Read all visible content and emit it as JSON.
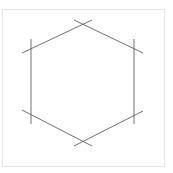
{
  "figure": {
    "background_color": "#ffffff",
    "frame": {
      "visible": true,
      "color": "#e6e6e6",
      "stroke_width": 1,
      "x": 2,
      "y": 9,
      "width": 163,
      "height": 158
    },
    "stroke": {
      "color": "#5a5a5a",
      "width": 1,
      "style": "solid",
      "opacity": 0.85
    },
    "shape": {
      "name": "hexagon",
      "sides": 6,
      "orientation": "pointy-top",
      "closed": false,
      "overshoot_px": 9,
      "vertices": [
        {
          "label": "top",
          "x": 83,
          "y": 24
        },
        {
          "label": "upper-right",
          "x": 134,
          "y": 48
        },
        {
          "label": "lower-right",
          "x": 134,
          "y": 115
        },
        {
          "label": "bottom",
          "x": 83,
          "y": 141
        },
        {
          "label": "lower-left",
          "x": 31,
          "y": 115
        },
        {
          "label": "upper-left",
          "x": 31,
          "y": 48
        }
      ],
      "edges": [
        {
          "name": "edge-top-right",
          "from": "top",
          "to": "upper-right",
          "x1": 74,
          "y1": 20,
          "x2": 143,
          "y2": 53
        },
        {
          "name": "edge-right",
          "from": "upper-right",
          "to": "lower-right",
          "x1": 134,
          "y1": 39,
          "x2": 134,
          "y2": 124
        },
        {
          "name": "edge-bottom-right",
          "from": "lower-right",
          "to": "bottom",
          "x1": 143,
          "y1": 111,
          "x2": 74,
          "y2": 146
        },
        {
          "name": "edge-bottom-left",
          "from": "bottom",
          "to": "lower-left",
          "x1": 92,
          "y1": 146,
          "x2": 22,
          "y2": 110
        },
        {
          "name": "edge-left",
          "from": "lower-left",
          "to": "upper-left",
          "x1": 31,
          "y1": 124,
          "x2": 31,
          "y2": 39
        },
        {
          "name": "edge-top-left",
          "from": "upper-left",
          "to": "top",
          "x1": 22,
          "y1": 53,
          "x2": 92,
          "y2": 20
        }
      ]
    },
    "labels": [],
    "annotations": []
  }
}
